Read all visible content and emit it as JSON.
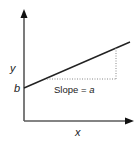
{
  "diagram": {
    "type": "linear-function-graph",
    "axes": {
      "x_label": "x",
      "y_label": "y"
    },
    "intercept_label": "b",
    "slope_label_prefix": "Slope = ",
    "slope_label_var": "a",
    "colors": {
      "axis": "#555555",
      "line": "#222222",
      "dotted": "#888888",
      "text": "#222222"
    }
  }
}
